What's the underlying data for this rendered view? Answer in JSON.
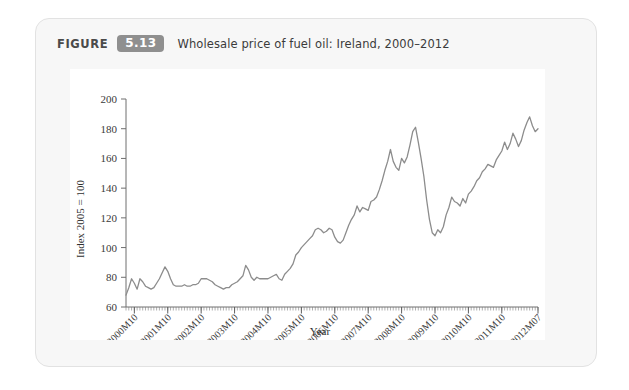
{
  "figure": {
    "label": "FIGURE",
    "number": "5.13",
    "title": "Wholesale price of fuel oil: Ireland, 2000–2012",
    "badge_color": "#8f8f8f",
    "card_background": "#f7f7f7",
    "panel_background": "#ffffff"
  },
  "chart_data": {
    "type": "line",
    "title": "Wholesale price of fuel oil: Ireland, 2000–2012",
    "xlabel": "Year",
    "ylabel": "Index 2005 = 100",
    "ylim": [
      60,
      200
    ],
    "yticks": [
      60,
      80,
      100,
      120,
      140,
      160,
      180,
      200
    ],
    "grid": false,
    "legend": "none",
    "line_color": "#8c8c8c",
    "x_tick_labels": [
      "2000M10",
      "2001M10",
      "2002M10",
      "2003M10",
      "2004M10",
      "2005M10",
      "2006M10",
      "2007M10",
      "2008M10",
      "2009M10",
      "2010M10",
      "2011M10",
      "2012M07"
    ],
    "x_start": "2000M07",
    "x_end": "2012M07",
    "x_count": 145,
    "series": [
      {
        "name": "Wholesale price of fuel oil (Index 2005 = 100)",
        "values": [
          68,
          73,
          79,
          76,
          72,
          79,
          77,
          74,
          73,
          72,
          73,
          76,
          79,
          83,
          87,
          84,
          79,
          75,
          74,
          74,
          74,
          75,
          74,
          74,
          75,
          75,
          76,
          79,
          79,
          79,
          78,
          77,
          75,
          74,
          73,
          72,
          73,
          73,
          75,
          76,
          77,
          79,
          81,
          88,
          85,
          80,
          78,
          80,
          79,
          79,
          79,
          79,
          80,
          81,
          82,
          79,
          78,
          82,
          84,
          86,
          89,
          95,
          97,
          100,
          102,
          104,
          106,
          108,
          112,
          113,
          112,
          110,
          111,
          113,
          112,
          107,
          104,
          103,
          105,
          110,
          115,
          119,
          122,
          128,
          124,
          127,
          126,
          125,
          131,
          132,
          134,
          139,
          145,
          152,
          158,
          166,
          158,
          154,
          152,
          160,
          157,
          161,
          169,
          178,
          181,
          171,
          160,
          148,
          132,
          119,
          110,
          108,
          112,
          110,
          114,
          122,
          127,
          134,
          131,
          130,
          128,
          133,
          130,
          136,
          138,
          141,
          145,
          147,
          151,
          153,
          156,
          155,
          154,
          159,
          162,
          165,
          171,
          166,
          170,
          177,
          173,
          168,
          172,
          179,
          184,
          188,
          182,
          178,
          180
        ]
      }
    ]
  }
}
